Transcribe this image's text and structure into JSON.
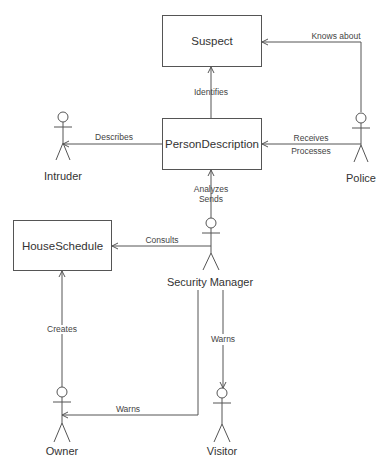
{
  "classes": [
    {
      "id": "suspect",
      "name": "Suspect",
      "x": 162,
      "y": 15,
      "w": 100,
      "h": 52
    },
    {
      "id": "person-description",
      "name": "PersonDescription",
      "x": 162,
      "y": 118,
      "w": 100,
      "h": 52
    },
    {
      "id": "house-schedule",
      "name": "HouseSchedule",
      "x": 13,
      "y": 220,
      "w": 99,
      "h": 51
    }
  ],
  "actors": [
    {
      "id": "intruder",
      "name": "Intruder",
      "cx": 63,
      "cy": 117
    },
    {
      "id": "police",
      "name": "Police",
      "cx": 361,
      "cy": 118
    },
    {
      "id": "security-manager",
      "name": "Security Manager",
      "cx": 211,
      "cy": 223
    },
    {
      "id": "owner",
      "name": "Owner",
      "cx": 62,
      "cy": 392
    },
    {
      "id": "visitor",
      "name": "Visitor",
      "cx": 222,
      "cy": 393
    }
  ],
  "associations": [
    {
      "id": "identifies",
      "labels": [
        "Identifies"
      ],
      "from": "PersonDescription",
      "to": "Suspect"
    },
    {
      "id": "knows-about",
      "labels": [
        "Knows about"
      ],
      "from": "Police",
      "to": "Suspect"
    },
    {
      "id": "describes",
      "labels": [
        "Describes"
      ],
      "from": "PersonDescription",
      "to": "Intruder"
    },
    {
      "id": "receives-processes",
      "labels": [
        "Receives",
        "Processes"
      ],
      "from": "Police",
      "to": "PersonDescription"
    },
    {
      "id": "analyzes-sends",
      "labels": [
        "Analyzes",
        "Sends"
      ],
      "from": "Security Manager",
      "to": "PersonDescription"
    },
    {
      "id": "consults",
      "labels": [
        "Consults"
      ],
      "from": "Security Manager",
      "to": "HouseSchedule"
    },
    {
      "id": "creates",
      "labels": [
        "Creates"
      ],
      "from": "Owner",
      "to": "HouseSchedule"
    },
    {
      "id": "warns-visitor",
      "labels": [
        "Warns"
      ],
      "from": "Security Manager",
      "to": "Visitor"
    },
    {
      "id": "warns-owner",
      "labels": [
        "Warns"
      ],
      "from": "Security Manager",
      "to": "Owner"
    }
  ]
}
